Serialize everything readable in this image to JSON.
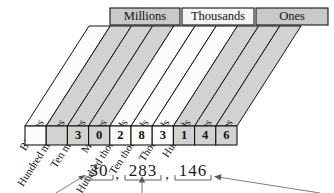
{
  "diagram": {
    "periods": [
      {
        "label": "Millions",
        "fill": "#c9c9c9",
        "span_cols": [
          1,
          3
        ]
      },
      {
        "label": "Thousands",
        "fill": "#f4f4f2",
        "span_cols": [
          4,
          6
        ]
      },
      {
        "label": "Ones",
        "fill": "#c9c9c9",
        "span_cols": [
          7,
          9
        ]
      }
    ],
    "columns": [
      {
        "label": "Billions",
        "digit": "",
        "fill": "#fcfcfa"
      },
      {
        "label": "Hundred millions",
        "digit": "",
        "fill": "#d2d2d0"
      },
      {
        "label": "Ten millions",
        "digit": "3",
        "fill": "#d2d2d0"
      },
      {
        "label": "Millions",
        "digit": "0",
        "fill": "#d2d2d0"
      },
      {
        "label": "Hundred thousands",
        "digit": "2",
        "fill": "#fcfcfa"
      },
      {
        "label": "Ten thousands",
        "digit": "8",
        "fill": "#fcfcfa"
      },
      {
        "label": "Thousands",
        "digit": "3",
        "fill": "#fcfcfa"
      },
      {
        "label": "Hundreds",
        "digit": "1",
        "fill": "#d2d2d0"
      },
      {
        "label": "Tens",
        "digit": "4",
        "fill": "#d2d2d0"
      },
      {
        "label": "Ones",
        "digit": "6",
        "fill": "#d2d2d0"
      }
    ],
    "numeral": {
      "full": "30,283,146",
      "groups": [
        "30",
        "283",
        "146"
      ],
      "separators": [
        ",",
        ","
      ],
      "group_digits": [
        [
          "3",
          "0"
        ],
        [
          "2",
          "8",
          "3"
        ],
        [
          "1",
          "4",
          "6"
        ]
      ]
    },
    "annotations": {
      "arrow_count": 3,
      "arrow_targets": [
        "30",
        "283",
        "146"
      ]
    },
    "colors": {
      "shaded_band": "#d2d2d0",
      "light_band": "#fcfcfa",
      "period_shaded": "#c9c9c9",
      "period_light": "#f4f4f2",
      "outline": "#141414",
      "text": "#121212",
      "annotation": "#5a5a5a"
    }
  }
}
